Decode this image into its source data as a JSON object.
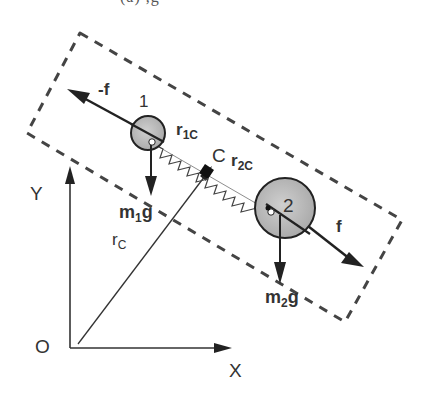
{
  "header_fragment": "(a)          ,g",
  "diagram": {
    "labels": {
      "force_left": "-f",
      "force_right": "f",
      "mass1": "1",
      "mass2": "2",
      "r1c_main": "r",
      "r1c_sub": "1C",
      "r2c_main": "r",
      "r2c_sub": "2C",
      "center": "C",
      "rc_main": "r",
      "rc_sub": "C",
      "m1g_m": "m",
      "m1g_sub": "1",
      "m1g_g": "g",
      "m2g_m": "m",
      "m2g_sub": "2",
      "m2g_g": "g",
      "axis_y": "Y",
      "axis_x": "X",
      "origin": "O"
    },
    "colors": {
      "stroke": "#222222",
      "ball_fill": "#b8b8b8",
      "dash": "#444444",
      "text": "#333333"
    }
  }
}
